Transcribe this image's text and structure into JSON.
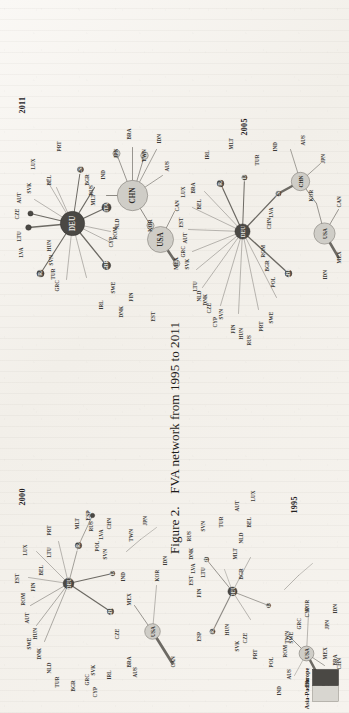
{
  "figure": {
    "caption_number": "Figure 2.",
    "caption_text": "FVA network from 1995 to 2011",
    "caption_full": "Figure 2.  FVA network from 1995 to 2011"
  },
  "legend": {
    "title": "",
    "items": [
      {
        "label": "Asia-Pacific",
        "color": "#d8d6d0",
        "swatch": "light-gray"
      },
      {
        "label": "Europe",
        "color": "#4a4844",
        "swatch": "dark-gray"
      }
    ]
  },
  "panels": [
    {
      "id": "panel-1995",
      "year": "1995",
      "hubs": [
        {
          "code": "DEU",
          "group": "Europe"
        },
        {
          "code": "FRA",
          "group": "Europe"
        },
        {
          "code": "GBR",
          "group": "Europe"
        },
        {
          "code": "ITA",
          "group": "Europe"
        },
        {
          "code": "USA",
          "group": "Asia-Pacific"
        }
      ],
      "labels": [
        "ESP",
        "EST",
        "LVA",
        "LTU",
        "FIN",
        "DNK",
        "RUS",
        "SVN",
        "TUR",
        "HUN",
        "CZE",
        "SVK",
        "PRT",
        "POL",
        "ROM",
        "SWE",
        "GRC",
        "CYP",
        "MLT",
        "BGR",
        "NLD",
        "BEL",
        "AUT",
        "LUX",
        "AUS",
        "IRL",
        "CAN",
        "MEX",
        "BRA",
        "TWN",
        "IND",
        "KOR",
        "JPN",
        "IDN",
        "CHN"
      ]
    },
    {
      "id": "panel-2000",
      "year": "2000",
      "hubs": [
        {
          "code": "DEU",
          "group": "Europe"
        },
        {
          "code": "FRA",
          "group": "Europe"
        },
        {
          "code": "GBR",
          "group": "Europe"
        },
        {
          "code": "ITA",
          "group": "Europe"
        },
        {
          "code": "ESP",
          "group": "Europe"
        },
        {
          "code": "USA",
          "group": "Asia-Pacific"
        }
      ],
      "labels": [
        "EST",
        "LUX",
        "ROM",
        "FIN",
        "BEL",
        "AUT",
        "HUN",
        "SWE",
        "DNK",
        "NLD",
        "TUR",
        "BGR",
        "GRC",
        "CYP",
        "SVK",
        "LTU",
        "PRT",
        "IRL",
        "CZE",
        "ITA",
        "SVN",
        "POL",
        "LVA",
        "RUS",
        "MLT",
        "BRA",
        "MEX",
        "IND",
        "CHN",
        "TWN",
        "JPN",
        "KOR",
        "IDN",
        "AUS",
        "CAN"
      ]
    },
    {
      "id": "panel-2005",
      "year": "2005",
      "hubs": [
        {
          "code": "DEU",
          "group": "Europe"
        },
        {
          "code": "FRA",
          "group": "Europe"
        },
        {
          "code": "ITA",
          "group": "Europe"
        },
        {
          "code": "GBR",
          "group": "Europe"
        },
        {
          "code": "ESP",
          "group": "Europe"
        },
        {
          "code": "USA",
          "group": "Asia-Pacific"
        },
        {
          "code": "CHN",
          "group": "Asia-Pacific"
        }
      ],
      "labels": [
        "LUX",
        "GRC",
        "SVK",
        "AUT",
        "EST",
        "BEL",
        "BRA",
        "IRL",
        "MLT",
        "LTU",
        "NLD",
        "CZE",
        "DNK",
        "CYP",
        "SVN",
        "FIN",
        "HUN",
        "RUS",
        "PRT",
        "SWE",
        "POL",
        "BGR",
        "ROM",
        "LVA",
        "TUR",
        "IND",
        "AUS",
        "JPN",
        "KOR",
        "IDN",
        "CAN",
        "MEX"
      ]
    },
    {
      "id": "panel-2011",
      "year": "2011",
      "hubs": [
        {
          "code": "DEU",
          "group": "Europe"
        },
        {
          "code": "FRA",
          "group": "Europe"
        },
        {
          "code": "ITA",
          "group": "Europe"
        },
        {
          "code": "GBR",
          "group": "Europe"
        },
        {
          "code": "ESP",
          "group": "Europe"
        },
        {
          "code": "NLD",
          "group": "Europe"
        },
        {
          "code": "CHN",
          "group": "Asia-Pacific"
        },
        {
          "code": "USA",
          "group": "Asia-Pacific"
        },
        {
          "code": "KOR",
          "group": "Asia-Pacific"
        },
        {
          "code": "TWN",
          "group": "Asia-Pacific"
        },
        {
          "code": "JPN",
          "group": "Asia-Pacific"
        },
        {
          "code": "MEX",
          "group": "Asia-Pacific"
        }
      ],
      "labels": [
        "LVA",
        "LTU",
        "CZE",
        "AUT",
        "SVK",
        "LUX",
        "BEL",
        "PRT",
        "BGR",
        "MLT",
        "IRL",
        "SWE",
        "DNK",
        "FIN",
        "EST",
        "GRC",
        "TUR",
        "SVN",
        "HUN",
        "CYP",
        "ROM",
        "IND",
        "BRA",
        "IDN",
        "AUS",
        "CAN"
      ]
    }
  ]
}
